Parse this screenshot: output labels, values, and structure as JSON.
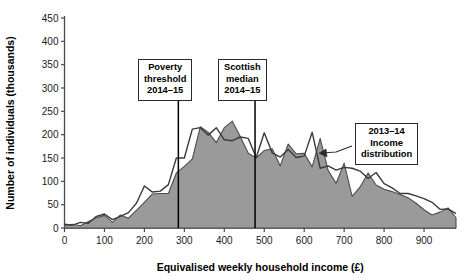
{
  "chart_data": {
    "type": "area",
    "title": "",
    "xlabel": "Equivalised weekly household income (£)",
    "ylabel": "Number of individuals (thousands)",
    "xlim": [
      0,
      980
    ],
    "ylim": [
      0,
      450
    ],
    "xticks": [
      0,
      100,
      200,
      300,
      400,
      500,
      600,
      700,
      800,
      900
    ],
    "yticks": [
      0,
      50,
      100,
      150,
      200,
      250,
      300,
      350,
      400,
      450
    ],
    "grid": false,
    "legend_position": "none",
    "series": [
      {
        "name": "2014-15 income distribution",
        "style": "filled-area",
        "fill_color": "#9a9a9a",
        "line_color": "#4d4d4d",
        "x": [
          0,
          20,
          40,
          60,
          80,
          100,
          120,
          140,
          160,
          180,
          200,
          220,
          240,
          260,
          280,
          300,
          320,
          340,
          360,
          380,
          400,
          420,
          440,
          460,
          480,
          500,
          520,
          540,
          560,
          580,
          600,
          620,
          640,
          660,
          680,
          700,
          720,
          740,
          760,
          780,
          800,
          820,
          840,
          860,
          880,
          900,
          920,
          940,
          960,
          980
        ],
        "values": [
          6,
          8,
          5,
          14,
          22,
          27,
          12,
          28,
          21,
          38,
          55,
          73,
          74,
          74,
          118,
          132,
          148,
          217,
          205,
          183,
          215,
          229,
          196,
          160,
          150,
          166,
          170,
          133,
          180,
          159,
          160,
          131,
          192,
          123,
          96,
          139,
          68,
          88,
          118,
          92,
          83,
          78,
          72,
          65,
          53,
          39,
          28,
          34,
          43,
          22
        ]
      },
      {
        "name": "2013-14 income distribution",
        "style": "line",
        "line_color": "#3a3a3a",
        "x": [
          0,
          20,
          40,
          60,
          80,
          100,
          120,
          140,
          160,
          180,
          200,
          220,
          240,
          260,
          280,
          300,
          320,
          340,
          360,
          380,
          400,
          420,
          440,
          460,
          480,
          500,
          520,
          540,
          560,
          580,
          600,
          620,
          640,
          660,
          680,
          700,
          720,
          740,
          760,
          780,
          800,
          820,
          840,
          860,
          880,
          900,
          920,
          940,
          960,
          980
        ],
        "values": [
          8,
          6,
          12,
          10,
          25,
          30,
          18,
          25,
          33,
          53,
          90,
          77,
          79,
          93,
          150,
          150,
          212,
          215,
          199,
          215,
          189,
          187,
          195,
          192,
          151,
          204,
          161,
          152,
          168,
          151,
          154,
          205,
          128,
          133,
          124,
          130,
          128,
          122,
          106,
          119,
          95,
          86,
          74,
          74,
          69,
          63,
          55,
          40,
          41,
          31
        ]
      }
    ],
    "markers": [
      {
        "name": "poverty-threshold",
        "x": 285,
        "label": [
          "Poverty",
          "threshold",
          "2014–15"
        ]
      },
      {
        "name": "scottish-median",
        "x": 477,
        "label": [
          "Scottish",
          "median",
          "2014–15"
        ]
      }
    ],
    "annotations": [
      {
        "name": "income-distribution-callout",
        "lines": [
          "2013–14",
          "Income",
          "distribution"
        ],
        "points_to_x": 700,
        "points_to_y": 130
      }
    ]
  },
  "axes": {
    "x_title": "Equivalised weekly household income (£)",
    "y_title": "Number of individuals (thousands)",
    "x_tick_labels": [
      "0",
      "100",
      "200",
      "300",
      "400",
      "500",
      "600",
      "700",
      "800",
      "900"
    ],
    "y_tick_labels": [
      "0",
      "50",
      "100",
      "150",
      "200",
      "250",
      "300",
      "350",
      "400",
      "450"
    ]
  },
  "annotations": {
    "poverty": {
      "line1": "Poverty",
      "line2": "threshold",
      "line3": "2014–15"
    },
    "median": {
      "line1": "Scottish",
      "line2": "median",
      "line3": "2014–15"
    },
    "distribution": {
      "line1": "2013–14",
      "line2": "Income",
      "line3": "distribution"
    }
  },
  "colors": {
    "area_fill": "#9a9a9a",
    "area_edge": "#4d4d4d",
    "line_2013": "#3a3a3a",
    "axis": "#4a4a4a",
    "marker_line": "#000000",
    "box_border": "#2b2b2b"
  }
}
